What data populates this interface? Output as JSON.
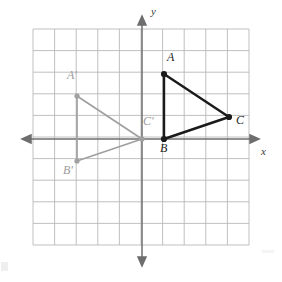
{
  "figure": {
    "type": "coordinate-plane-reflection",
    "grid": {
      "x_min": -5,
      "x_max": 5,
      "y_min": -5,
      "y_max": 5,
      "cell_size_px": 21.6,
      "origin_px": {
        "x": 142,
        "y": 139
      },
      "left_px": 33,
      "top_px": 29,
      "right_px": 249,
      "bottom_px": 245,
      "line_color": "#b9b9b9",
      "background": "#ffffff",
      "columns": 10,
      "rows": 10
    },
    "axes": {
      "x_label": "x",
      "y_label": "y",
      "color": "#6e6e6e",
      "arrows": [
        "left",
        "right",
        "up",
        "down"
      ],
      "x_label_pos_px": {
        "x": 262,
        "y": 146
      },
      "y_label_pos_px": {
        "x": 151,
        "y": 8
      }
    },
    "shapes": [
      {
        "name": "triangle-abc",
        "role": "preimage",
        "color": "#1a1a1a",
        "stroke_width": 2.4,
        "vertices": [
          {
            "label": "A",
            "x": 1,
            "y": 3,
            "px": {
              "x": 164,
              "y": 74
            },
            "label_px": {
              "x": 167,
              "y": 53
            }
          },
          {
            "label": "B",
            "x": 1,
            "y": 0,
            "px": {
              "x": 164,
              "y": 139
            },
            "label_px": {
              "x": 161,
              "y": 143
            }
          },
          {
            "label": "C",
            "x": 4,
            "y": 1,
            "px": {
              "x": 229,
              "y": 117
            },
            "label_px": {
              "x": 236,
              "y": 117
            }
          }
        ]
      },
      {
        "name": "triangle-a-prime-b-prime-c-prime",
        "role": "image",
        "color": "#a0a0a0",
        "stroke_width": 1.6,
        "vertices": [
          {
            "label": "A'",
            "x": -3,
            "y": 2,
            "px": {
              "x": 77,
              "y": 96
            },
            "label_px": {
              "x": 68,
              "y": 72
            }
          },
          {
            "label": "B'",
            "x": -3,
            "y": -1,
            "px": {
              "x": 77,
              "y": 161
            },
            "label_px": {
              "x": 64,
              "y": 165
            }
          },
          {
            "label": "C'",
            "x": 0,
            "y": 0,
            "px": {
              "x": 142,
              "y": 139
            },
            "label_px": {
              "x": 144,
              "y": 118
            }
          }
        ]
      }
    ]
  }
}
